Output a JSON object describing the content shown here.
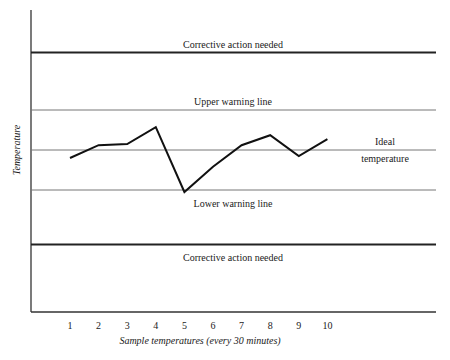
{
  "chart_data": {
    "type": "line",
    "title": "",
    "xlabel": "Sample temperatures (every 30 minutes)",
    "ylabel": "Temperature",
    "x": [
      1,
      2,
      3,
      4,
      5,
      6,
      7,
      8,
      9,
      10
    ],
    "series": [
      {
        "name": "Sample temperature (relative to ideal)",
        "values": [
          -0.2,
          0.12,
          0.15,
          0.57,
          -1.05,
          -0.42,
          0.12,
          0.37,
          -0.15,
          0.27
        ]
      }
    ],
    "reference_lines": [
      {
        "label": "Corrective action needed",
        "value": 2.45,
        "style": "thick"
      },
      {
        "label": "Upper warning line",
        "value": 1.0,
        "style": "thin"
      },
      {
        "label": "Ideal temperature",
        "value": 0.0,
        "style": "thin"
      },
      {
        "label": "Lower warning line",
        "value": -1.0,
        "style": "thin"
      },
      {
        "label": "Corrective action needed",
        "value": -2.35,
        "style": "thick"
      }
    ],
    "grid": false,
    "legend": "none",
    "note": "Y values are relative units: ideal = 0, warning lines = ±1; y-axis has no numeric ticks"
  },
  "labels": {
    "corrective_upper": "Corrective action needed",
    "upper_warning": "Upper warning line",
    "ideal_line1": "Ideal",
    "ideal_line2": "temperature",
    "lower_warning": "Lower warning line",
    "corrective_lower": "Corrective action needed"
  },
  "ticks": [
    "1",
    "2",
    "3",
    "4",
    "5",
    "6",
    "7",
    "8",
    "9",
    "10"
  ]
}
